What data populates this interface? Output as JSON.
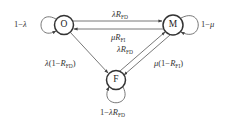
{
  "diagram": {
    "type": "state-transition",
    "nodes": [
      {
        "id": "O",
        "label": "O",
        "cx": 64,
        "cy": 25,
        "r": 9
      },
      {
        "id": "M",
        "label": "M",
        "cx": 173,
        "cy": 25,
        "r": 10
      },
      {
        "id": "F",
        "label": "F",
        "cx": 116,
        "cy": 80,
        "r": 9
      }
    ],
    "edges": [
      {
        "from": "O",
        "to": "O",
        "label": "1−λ"
      },
      {
        "from": "M",
        "to": "M",
        "label": "1−μ"
      },
      {
        "from": "F",
        "to": "F",
        "label": "1−λR_FD"
      },
      {
        "from": "O",
        "to": "M",
        "label": "λR_FD"
      },
      {
        "from": "M",
        "to": "O",
        "label": "μR_FI"
      },
      {
        "from": "O",
        "to": "F",
        "label": "λ(1−R_FD)"
      },
      {
        "from": "F",
        "to": "M",
        "label": "λR_FD"
      },
      {
        "from": "M",
        "to": "F",
        "label": "μ(1−R_FI)"
      }
    ]
  },
  "labels": {
    "node_o": "O",
    "node_m": "M",
    "node_f": "F",
    "self_o": {
      "pre": "1−",
      "var": "λ"
    },
    "self_m": {
      "pre": "1−",
      "var": "μ"
    },
    "self_f": {
      "pre": "1−",
      "var": "λ",
      "R": "R",
      "sub": "FD"
    },
    "o_to_m": {
      "var": "λ",
      "R": "R",
      "sub": "FD"
    },
    "m_to_o": {
      "var": "μ",
      "R": "R",
      "sub": "FI"
    },
    "o_to_f": {
      "var": "λ",
      "open": "(1−",
      "R": "R",
      "sub": "FD",
      "close": ")"
    },
    "f_to_m": {
      "var": "λ",
      "R": "R",
      "sub": "FD"
    },
    "m_to_f": {
      "var": "μ",
      "open": "(1−",
      "R": "R",
      "sub": "FI",
      "close": ")"
    }
  },
  "colors": {
    "stroke": "#444444",
    "text": "#333333",
    "background": "#ffffff"
  }
}
